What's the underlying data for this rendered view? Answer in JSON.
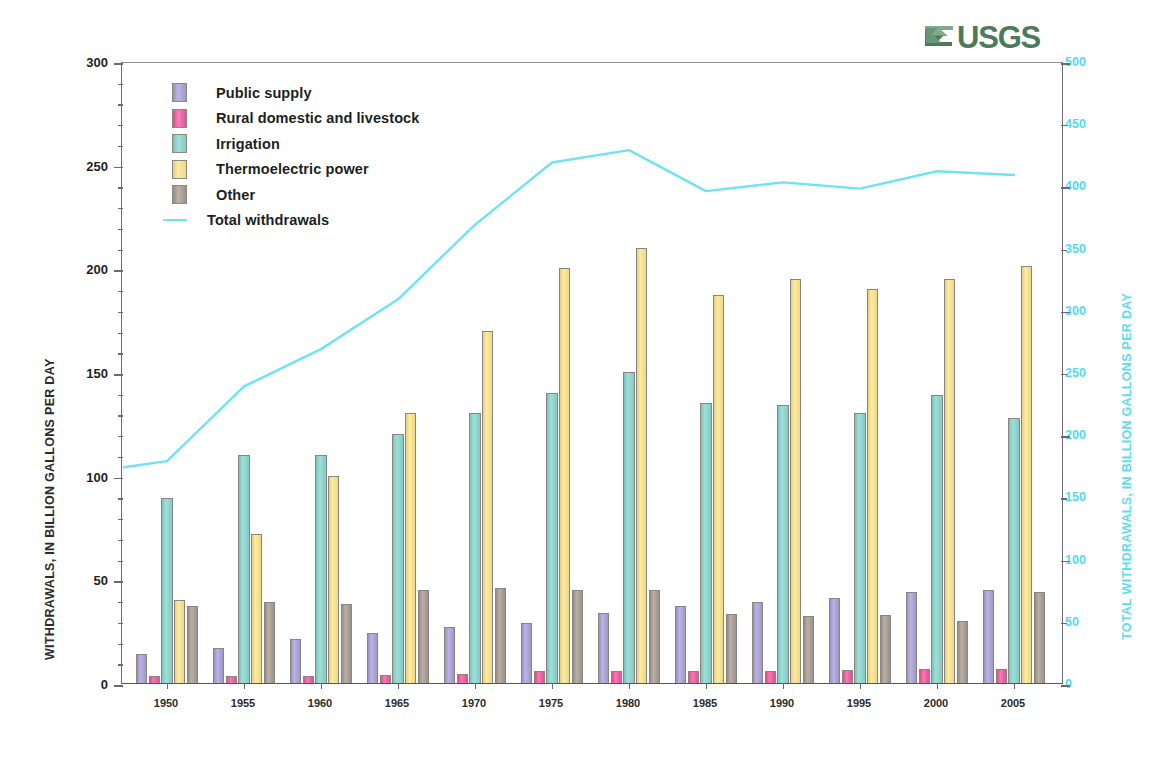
{
  "logo": {
    "wordmark": "USGS",
    "wave_icon": "usgs-wave-icon",
    "color": "#4d7a5a"
  },
  "axes": {
    "left": {
      "title": "WITHDRAWALS, IN BILLION GALLONS PER DAY",
      "min": 0,
      "max": 300,
      "major_step": 50,
      "minor_step": 10,
      "ticks": [
        "0",
        "50",
        "100",
        "150",
        "200",
        "250",
        "300"
      ],
      "color": "#1f1f1f"
    },
    "right": {
      "title": "TOTAL WITHDRAWALS, IN BILLION GALLONS PER DAY",
      "min": 0,
      "max": 500,
      "major_step": 50,
      "ticks": [
        "0",
        "50",
        "100",
        "150",
        "200",
        "250",
        "300",
        "350",
        "400",
        "450",
        "500"
      ],
      "color": "#54d9ef"
    },
    "x": {
      "ticks": [
        "1950",
        "1955",
        "1960",
        "1965",
        "1970",
        "1975",
        "1980",
        "1985",
        "1990",
        "1995",
        "2000",
        "2005"
      ]
    }
  },
  "legend": {
    "items": [
      {
        "label": "Public supply",
        "type": "swatch",
        "color": "#a89ed8",
        "icon": "legend-swatch-public-supply"
      },
      {
        "label": "Rural domestic and livestock",
        "type": "swatch",
        "color": "#f2549c",
        "icon": "legend-swatch-rural-domestic"
      },
      {
        "label": "Irrigation",
        "type": "swatch",
        "color": "#86d6cd",
        "icon": "legend-swatch-irrigation"
      },
      {
        "label": "Thermoelectric power",
        "type": "swatch",
        "color": "#fbe489",
        "icon": "legend-swatch-thermoelectric"
      },
      {
        "label": "Other",
        "type": "swatch",
        "color": "#a5998f",
        "icon": "legend-swatch-other"
      },
      {
        "label": "Total withdrawals",
        "type": "line",
        "color": "#6fe3f2",
        "icon": "legend-line-total-withdrawals"
      }
    ]
  },
  "chart_data": {
    "type": "bar",
    "title": "",
    "xlabel": "",
    "ylabel": "WITHDRAWALS, IN BILLION GALLONS PER DAY",
    "y2label": "TOTAL WITHDRAWALS, IN BILLION GALLONS PER DAY",
    "ylim": [
      0,
      300
    ],
    "y2lim": [
      0,
      500
    ],
    "grid": false,
    "legend_position": "upper-left-inside",
    "categories": [
      "1950",
      "1955",
      "1960",
      "1965",
      "1970",
      "1975",
      "1980",
      "1985",
      "1990",
      "1995",
      "2000",
      "2005"
    ],
    "series": [
      {
        "name": "Public supply",
        "axis": "left",
        "kind": "bar",
        "color": "#a89ed8",
        "values": [
          14,
          17,
          21,
          24,
          27,
          29,
          34,
          37,
          39,
          41,
          44,
          45
        ]
      },
      {
        "name": "Rural domestic and livestock",
        "axis": "left",
        "kind": "bar",
        "color": "#f2549c",
        "values": [
          3.6,
          3.6,
          3.6,
          4.0,
          4.5,
          5.6,
          5.6,
          5.6,
          5.6,
          6.5,
          6.8,
          7.0
        ]
      },
      {
        "name": "Irrigation",
        "axis": "left",
        "kind": "bar",
        "color": "#86d6cd",
        "values": [
          89,
          110,
          110,
          120,
          130,
          140,
          150,
          135,
          134,
          130,
          139,
          128
        ]
      },
      {
        "name": "Thermoelectric power",
        "axis": "left",
        "kind": "bar",
        "color": "#fbe489",
        "values": [
          40,
          72,
          100,
          130,
          170,
          200,
          210,
          187,
          195,
          190,
          195,
          201
        ]
      },
      {
        "name": "Other",
        "axis": "left",
        "kind": "bar",
        "color": "#a5998f",
        "values": [
          37,
          39,
          38,
          45,
          46,
          45,
          45,
          33.5,
          32.5,
          33,
          30,
          44
        ]
      },
      {
        "name": "Total withdrawals",
        "axis": "right",
        "kind": "line",
        "color": "#6fe3f2",
        "values": [
          180,
          240,
          270,
          310,
          370,
          420,
          430,
          397,
          404,
          399,
          413,
          410
        ]
      }
    ]
  }
}
